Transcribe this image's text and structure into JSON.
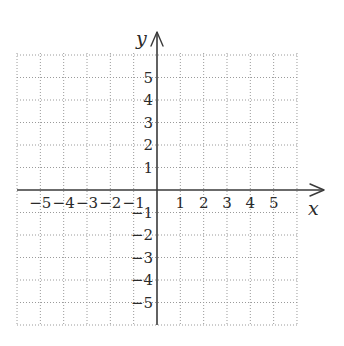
{
  "chart_data": {
    "type": "scatter",
    "title": "",
    "xlabel": "x",
    "ylabel": "y",
    "xlim": [
      -6,
      6
    ],
    "ylim": [
      -6,
      6
    ],
    "grid": true,
    "grid_style": "dotted",
    "x_tick_labels": [
      "−5",
      "−4",
      "−3",
      "−2",
      "−1",
      "1",
      "2",
      "3",
      "4",
      "5"
    ],
    "x_ticks": [
      -5,
      -4,
      -3,
      -2,
      -1,
      1,
      2,
      3,
      4,
      5
    ],
    "y_tick_labels": [
      "5",
      "4",
      "3",
      "2",
      "1",
      "−1",
      "−2",
      "−3",
      "−4",
      "−5"
    ],
    "y_ticks": [
      5,
      4,
      3,
      2,
      1,
      -1,
      -2,
      -3,
      -4,
      -5
    ],
    "series": [],
    "legend": null
  },
  "colors": {
    "grid": "#9a9a9a",
    "axis": "#3a3a3a",
    "text": "#2a2a2a",
    "background": "#ffffff"
  },
  "layout": {
    "origin_x": 157,
    "origin_y": 190,
    "step_x": 23.33,
    "step_y": 22.5,
    "grid_left": 17,
    "grid_right": 297,
    "grid_top": 53,
    "grid_bottom": 325,
    "x_axis_end": 324,
    "y_axis_top": 32
  }
}
